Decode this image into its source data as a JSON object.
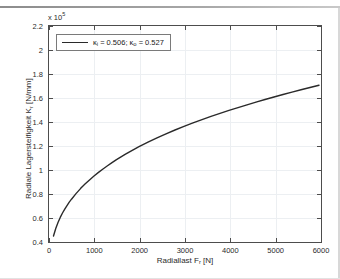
{
  "figure": {
    "background": "#ffffff",
    "axis_color": "#4d4d4d",
    "grid_color": "#eceff2",
    "curve_color": "#2a2a2a"
  },
  "exponent_label": {
    "prefix": "x 10",
    "exponent": "5"
  },
  "legend": {
    "entries": [
      {
        "label": "κᵢ = 0.506; κₒ = 0.527",
        "color": "#2a2a2a"
      }
    ],
    "position": "top-left",
    "kappa_inner_symbol": "κ",
    "kappa_inner_sub": "i",
    "kappa_inner_value": "0.506",
    "kappa_outer_symbol": "κ",
    "kappa_outer_sub": "o",
    "kappa_outer_value": "0.527",
    "separator": "; ",
    "equals": " = "
  },
  "chart_data": {
    "type": "line",
    "title": "",
    "subtitle": "",
    "xlabel": "Radiallast F_r [N]",
    "xlabel_main": "Radiallast F",
    "xlabel_sub": "r",
    "xlabel_unit": " [N]",
    "ylabel": "Radiale Lagersteifigkeit K_r [N/mm]",
    "ylabel_main": "Radiale Lagersteifigkeit K",
    "ylabel_sub": "r",
    "ylabel_unit": " [N/mm]",
    "y_scale_multiplier": 100000,
    "y_scale_text": "x 10^5",
    "xlim": [
      0,
      6000
    ],
    "ylim": [
      0.4,
      2.2
    ],
    "xticks": [
      0,
      1000,
      2000,
      3000,
      4000,
      5000,
      6000
    ],
    "xtick_labels": [
      "0",
      "1000",
      "2000",
      "3000",
      "4000",
      "5000",
      "6000"
    ],
    "yticks": [
      0.4,
      0.6,
      0.8,
      1.0,
      1.2,
      1.4,
      1.6,
      1.8,
      2.0,
      2.2
    ],
    "ytick_labels": [
      "0.4",
      "0.6",
      "0.8",
      "1",
      "1.2",
      "1.4",
      "1.6",
      "1.8",
      "2",
      "2.2"
    ],
    "grid": true,
    "legend_position": "upper left",
    "series": [
      {
        "name": "κᵢ = 0.506; κₒ = 0.527",
        "color": "#2a2a2a",
        "linewidth": 1.4,
        "x": [
          100,
          150,
          200,
          250,
          300,
          350,
          400,
          450,
          500,
          600,
          700,
          800,
          900,
          1000,
          1100,
          1200,
          1300,
          1400,
          1500,
          1600,
          1700,
          1800,
          1900,
          2000,
          2200,
          2400,
          2600,
          2800,
          3000,
          3200,
          3400,
          3600,
          3800,
          4000,
          4200,
          4400,
          4600,
          4800,
          5000,
          5200,
          5400,
          5600,
          5800,
          6000
        ],
        "y": [
          0.437,
          0.5,
          0.551,
          0.593,
          0.63,
          0.663,
          0.693,
          0.721,
          0.746,
          0.793,
          0.835,
          0.873,
          0.908,
          0.941,
          0.971,
          1.0,
          1.027,
          1.053,
          1.078,
          1.101,
          1.124,
          1.146,
          1.167,
          1.187,
          1.225,
          1.261,
          1.295,
          1.327,
          1.357,
          1.386,
          1.414,
          1.441,
          1.466,
          1.491,
          1.515,
          1.538,
          1.561,
          1.583,
          1.604,
          1.625,
          1.645,
          1.665,
          1.684,
          1.703
        ]
      }
    ],
    "relationship_note": "K_r proportional to F_r^(1/3)",
    "curve_start_point": {
      "x": 100,
      "y": 0.437
    },
    "curve_end_point": {
      "x": 6000,
      "y": 2.13
    }
  }
}
